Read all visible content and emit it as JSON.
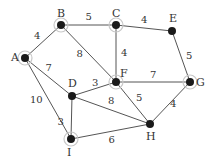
{
  "graph": {
    "nodes": [
      {
        "id": "A",
        "x": 25,
        "y": 58,
        "halo": true
      },
      {
        "id": "B",
        "x": 61,
        "y": 25,
        "halo": true
      },
      {
        "id": "C",
        "x": 116,
        "y": 25,
        "halo": true
      },
      {
        "id": "E",
        "x": 172,
        "y": 31,
        "halo": false
      },
      {
        "id": "F",
        "x": 116,
        "y": 82,
        "halo": true
      },
      {
        "id": "G",
        "x": 190,
        "y": 82,
        "halo": true
      },
      {
        "id": "D",
        "x": 72,
        "y": 96,
        "halo": false
      },
      {
        "id": "H",
        "x": 150,
        "y": 124,
        "halo": false
      },
      {
        "id": "I",
        "x": 71,
        "y": 139,
        "halo": true
      }
    ],
    "edges": [
      {
        "from": "A",
        "to": "B",
        "weight": "4"
      },
      {
        "from": "B",
        "to": "C",
        "weight": "5"
      },
      {
        "from": "C",
        "to": "E",
        "weight": "4"
      },
      {
        "from": "B",
        "to": "F",
        "weight": "8"
      },
      {
        "from": "C",
        "to": "F",
        "weight": "4"
      },
      {
        "from": "E",
        "to": "G",
        "weight": "5"
      },
      {
        "from": "A",
        "to": "D",
        "weight": "7"
      },
      {
        "from": "D",
        "to": "F",
        "weight": "3"
      },
      {
        "from": "F",
        "to": "G",
        "weight": "7"
      },
      {
        "from": "A",
        "to": "I",
        "weight": "10"
      },
      {
        "from": "D",
        "to": "H",
        "weight": "8"
      },
      {
        "from": "F",
        "to": "H",
        "weight": "5"
      },
      {
        "from": "G",
        "to": "H",
        "weight": "4"
      },
      {
        "from": "D",
        "to": "I",
        "weight": "3"
      },
      {
        "from": "I",
        "to": "H",
        "weight": "6"
      }
    ]
  }
}
